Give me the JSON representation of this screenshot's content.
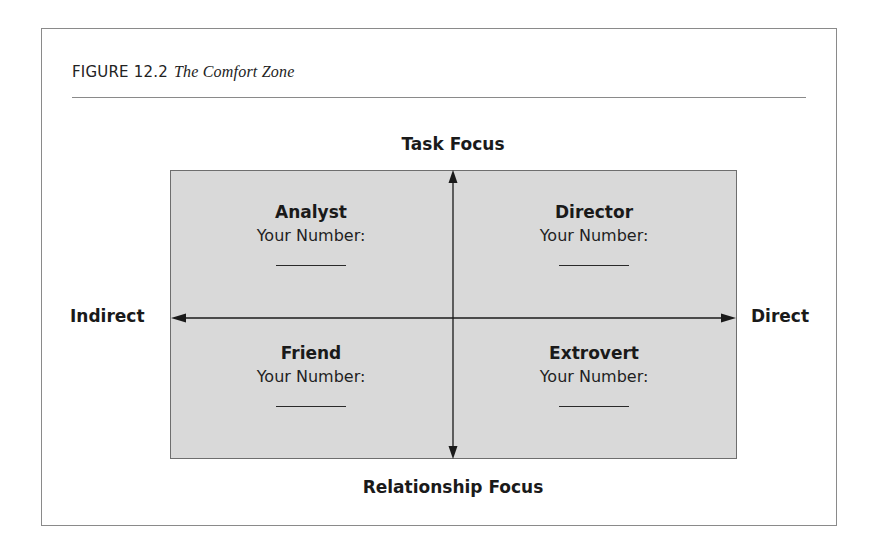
{
  "figure": {
    "label": "FIGURE 12.2",
    "title": "The Comfort Zone"
  },
  "axes": {
    "top": "Task Focus",
    "bottom": "Relationship Focus",
    "left": "Indirect",
    "right": "Direct"
  },
  "quadrants": [
    {
      "position": "top-left",
      "name": "Analyst",
      "prompt": "Your Number:",
      "value": ""
    },
    {
      "position": "top-right",
      "name": "Director",
      "prompt": "Your Number:",
      "value": ""
    },
    {
      "position": "bottom-left",
      "name": "Friend",
      "prompt": "Your Number:",
      "value": ""
    },
    {
      "position": "bottom-right",
      "name": "Extrovert",
      "prompt": "Your Number:",
      "value": ""
    }
  ],
  "colors": {
    "quadrant_fill": "#d9d9d9",
    "lines": "#1a1a1a",
    "frame": "#8a8a8a"
  }
}
